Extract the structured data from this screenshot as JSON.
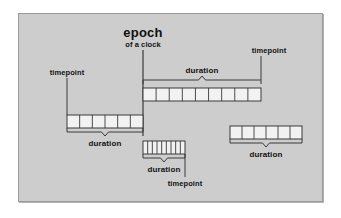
{
  "figure": {
    "kind": "epoch-timeline-diagram",
    "background_color": "#cdcdcd",
    "frame_border_color": "#9a9a9a",
    "page_background": "#ffffff",
    "stroke_color": "#3a3a3a",
    "cell_fill_color": "#f2f2f2",
    "text_color": "#111111"
  },
  "epoch": {
    "title": "epoch",
    "subtitle": "of a clock",
    "axis_x": 124,
    "axis_y_top": 36,
    "axis_y_bottom": 122
  },
  "labels": {
    "timepoint": "timepoint",
    "duration": "duration"
  },
  "bars": [
    {
      "id": "top-bar",
      "name": "top-duration-bar",
      "x": 124,
      "y": 74,
      "width": 118,
      "height": 13,
      "cells": 9,
      "brace": {
        "position": "above",
        "x": 124,
        "y": 66,
        "width": 118,
        "depth": 4,
        "label": "duration",
        "label_x": 183,
        "label_y": 53
      },
      "timepoint": {
        "label": "timepoint",
        "label_x": 250,
        "label_y": 33,
        "line_x": 242,
        "line_y_top": 42,
        "line_y_bottom": 66
      }
    },
    {
      "id": "left-bar",
      "name": "left-duration-bar",
      "x": 48,
      "y": 101,
      "width": 76,
      "height": 13,
      "cells": 6,
      "brace": {
        "position": "below",
        "x": 48,
        "y": 118,
        "width": 76,
        "depth": 4,
        "label": "duration",
        "label_x": 86,
        "label_y": 126
      },
      "timepoint": {
        "label": "timepoint",
        "label_x": 48,
        "label_y": 55,
        "line_x": 48,
        "line_y_top": 64,
        "line_y_bottom": 101
      }
    },
    {
      "id": "middle-bar",
      "name": "middle-duration-bar",
      "x": 124,
      "y": 127,
      "width": 42,
      "height": 13,
      "cells": 9,
      "brace": {
        "position": "below",
        "x": 124,
        "y": 144,
        "width": 42,
        "depth": 4,
        "label": "duration",
        "label_x": 145,
        "label_y": 152
      },
      "timepoint": {
        "label": "timepoint",
        "label_x": 166,
        "label_y": 166,
        "line_x": 166,
        "line_y_top": 140,
        "line_y_bottom": 163
      }
    },
    {
      "id": "right-bar",
      "name": "right-duration-bar",
      "x": 211,
      "y": 112,
      "width": 72,
      "height": 13,
      "cells": 6,
      "brace": {
        "position": "below",
        "x": 211,
        "y": 129,
        "width": 72,
        "depth": 4,
        "label": "duration",
        "label_x": 247,
        "label_y": 137
      },
      "timepoint": null
    }
  ]
}
